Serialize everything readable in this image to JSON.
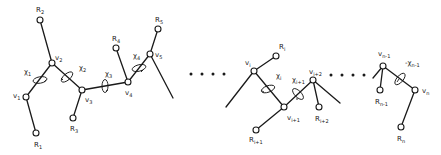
{
  "diagram": {
    "colors": {
      "ink": "#1a1a1a",
      "background": "#ffffff"
    },
    "labels": {
      "R1": "R",
      "R1_sub": "1",
      "R2": "R",
      "R2_sub": "2",
      "R3": "R",
      "R3_sub": "3",
      "R4": "R",
      "R4_sub": "4",
      "R5": "R",
      "R5_sub": "5",
      "v1": "v",
      "v1_sub": "1",
      "v2": "v",
      "v2_sub": "2",
      "v3": "v",
      "v3_sub": "3",
      "v4": "v",
      "v4_sub": "4",
      "v5": "v",
      "v5_sub": "5",
      "chi1": "χ",
      "chi1_sub": "1",
      "chi2": "χ",
      "chi2_sub": "2",
      "chi3": "χ",
      "chi3_sub": "3",
      "chi4": "χ",
      "chi4_sub": "4",
      "Ri": "R",
      "Ri_sub": "i",
      "vi": "v",
      "vi_sub": "i",
      "chii": "χ",
      "chii_sub": "i",
      "chii1": "χ",
      "chii1_sub": "i+1",
      "vi1": "v",
      "vi1_sub": "i+1",
      "Ri1": "R",
      "Ri1_sub": "i+1",
      "vi2": "v",
      "vi2_sub": "i+2",
      "Ri2": "R",
      "Ri2_sub": "i+2",
      "vn1": "v",
      "vn1_sub": "n-1",
      "chin1": "-χ",
      "chin1_sub": "n-1",
      "Rn1": "R",
      "Rn1_sub": "n-1",
      "vn": "v",
      "vn_sub": "n",
      "Rn": "R",
      "Rn_sub": "n"
    },
    "ellipsis_groups": 2
  }
}
